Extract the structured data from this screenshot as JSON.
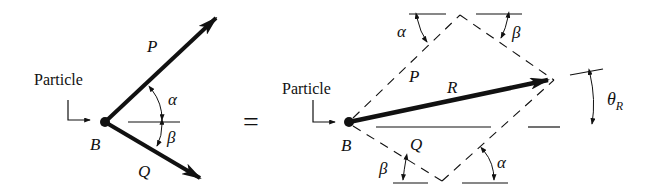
{
  "diagram": {
    "left": {
      "particle_label": "Particle",
      "point_label": "B",
      "vector_p_label": "P",
      "vector_q_label": "Q",
      "angle_alpha": "α",
      "angle_beta": "β"
    },
    "equals_sign": "=",
    "right": {
      "particle_label": "Particle",
      "point_label": "B",
      "vector_p_label": "P",
      "vector_q_label": "Q",
      "resultant_label": "R",
      "theta_symbol": "θ",
      "theta_subscript": "R",
      "angle_alpha_top": "α",
      "angle_beta_top": "β",
      "angle_beta_bottom": "β",
      "angle_alpha_bottom": "α"
    },
    "colors": {
      "ink": "#111111",
      "background": "#ffffff"
    }
  }
}
